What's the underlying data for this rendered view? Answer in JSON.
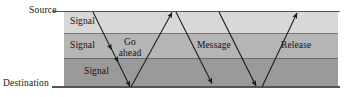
{
  "figure": {
    "type": "signal-propagation-diagram",
    "width": 351,
    "height": 97,
    "background": "#ffffff"
  },
  "axis": {
    "source_label": "Source",
    "destination_label": "Destination",
    "rule_color": "#555555"
  },
  "bands": [
    {
      "name": "top",
      "label": "Signal",
      "color": "#d8d8d8",
      "y": 12,
      "height": 21
    },
    {
      "name": "middle",
      "label": "Signal",
      "color": "#b5b5b5",
      "y": 33,
      "height": 25
    },
    {
      "name": "bottom",
      "label": "Signal",
      "color": "#9a9a9a",
      "y": 58,
      "height": 29
    }
  ],
  "labels": {
    "signal_top": "Signal",
    "signal_middle": "Signal",
    "signal_bottom": "Signal",
    "go_ahead_line1": "Go",
    "go_ahead_line2": "ahead",
    "message": "Message",
    "release": "Release"
  },
  "arrows": [
    {
      "name": "signal-down-first",
      "direction": "down",
      "from": [
        93,
        12
      ],
      "to": [
        130,
        87
      ],
      "arrowheads": [
        "mid-33",
        "mid-58",
        "end"
      ]
    },
    {
      "name": "go-ahead-up",
      "direction": "up",
      "from": [
        131,
        87
      ],
      "to": [
        172,
        12
      ],
      "arrowheads": [
        "end"
      ]
    },
    {
      "name": "message-down",
      "direction": "down",
      "from": [
        176,
        12
      ],
      "to": [
        212,
        84
      ],
      "arrowheads": [
        "end"
      ]
    },
    {
      "name": "message-down-second",
      "direction": "down",
      "from": [
        219,
        12
      ],
      "to": [
        256,
        86
      ],
      "arrowheads": [
        "end"
      ]
    },
    {
      "name": "release-up",
      "direction": "up",
      "from": [
        262,
        87
      ],
      "to": [
        297,
        13
      ],
      "arrowheads": [
        "end"
      ]
    }
  ],
  "colors": {
    "stroke": "#1a1a1a",
    "text": "#141414",
    "band_top": "#d8d8d8",
    "band_middle": "#b5b5b5",
    "band_bottom": "#9a9a9a"
  }
}
